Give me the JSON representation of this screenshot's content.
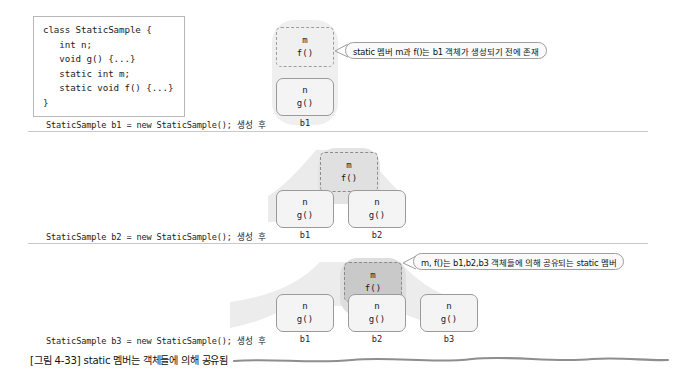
{
  "code_block": {
    "lines": [
      "class StaticSample {",
      "   int n;",
      "   void g() {...}",
      "   static int m;",
      "   static void f() {...}",
      "}"
    ]
  },
  "stages": [
    {
      "caption": "StaticSample b1 = new StaticSample(); 생성 후",
      "static_box": {
        "line1": "m",
        "line2": "f()"
      },
      "objects": [
        {
          "label": "b1",
          "line1": "n",
          "line2": "g()"
        }
      ],
      "callout": "static 멤버 m과 f()는 b1 객체가 생성되기 전에 존재"
    },
    {
      "caption": "StaticSample b2 = new StaticSample(); 생성 후",
      "static_box": {
        "line1": "m",
        "line2": "f()"
      },
      "objects": [
        {
          "label": "b1",
          "line1": "n",
          "line2": "g()"
        },
        {
          "label": "b2",
          "line1": "n",
          "line2": "g()"
        }
      ],
      "callout": ""
    },
    {
      "caption": "StaticSample b3 = new StaticSample(); 생성 후",
      "static_box": {
        "line1": "m",
        "line2": "f()"
      },
      "objects": [
        {
          "label": "b1",
          "line1": "n",
          "line2": "g()"
        },
        {
          "label": "b2",
          "line1": "n",
          "line2": "g()"
        },
        {
          "label": "b3",
          "line1": "n",
          "line2": "g()"
        }
      ],
      "callout": "m, f()는 b1,b2,b3 객체들에 의해 공유되는 static 멤버"
    }
  ],
  "figure_caption": "[그림 4-33] static 멤버는 객체들에 의해 공유됨",
  "colors": {
    "page_background": "#ffffff",
    "box_border": "#9a9a9a",
    "box_fill": "#f4f4f4",
    "static_fill_stage1": "#f0f0f0",
    "static_fill_stage2": "#e0e0e0",
    "static_fill_stage3": "#c9c9c9",
    "rule": "#c9c9c9",
    "blob": "#e8e8e8",
    "text": "#1c1c1c"
  }
}
